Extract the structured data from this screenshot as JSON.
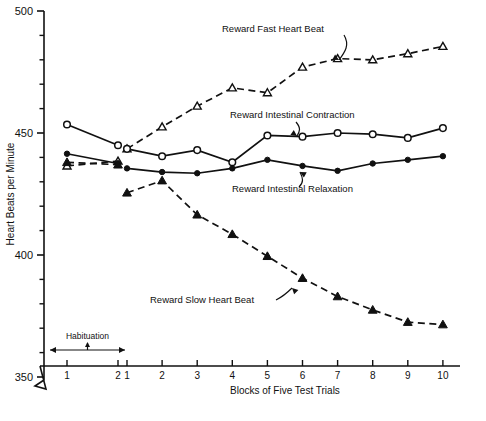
{
  "chart_data": {
    "type": "line",
    "title": "",
    "xlabel": "Blocks of Five Test Trials",
    "ylabel": "Heart Beats per Minute",
    "ylim": [
      350,
      500
    ],
    "y_ticks_major": [
      350,
      400,
      450,
      500
    ],
    "y_ticks_minor_step": 10,
    "axis_break": true,
    "grid": false,
    "legend_position": "inline-annotations",
    "x_habituation": [
      "1",
      "2"
    ],
    "x_test": [
      "1",
      "2",
      "3",
      "4",
      "5",
      "6",
      "7",
      "8",
      "9",
      "10"
    ],
    "habituation_label": "Habituation",
    "series": [
      {
        "name": "Reward Fast Heart Beat",
        "marker": "open-triangle",
        "line": "dashed",
        "habituation": [
          436.5,
          438.5
        ],
        "values": [
          443.5,
          452.5,
          461.0,
          468.5,
          466.5,
          477.0,
          480.5,
          480.0,
          482.5,
          485.5
        ]
      },
      {
        "name": "Reward Intestinal Contraction",
        "marker": "open-circle",
        "line": "solid",
        "habituation": [
          453.5,
          445.0
        ],
        "values": [
          443.5,
          440.5,
          443.0,
          438.0,
          449.0,
          448.5,
          450.0,
          449.5,
          448.0,
          452.0
        ]
      },
      {
        "name": "Reward Intestinal Relaxation",
        "marker": "filled-circle",
        "line": "solid",
        "habituation": [
          441.5,
          437.5
        ],
        "values": [
          435.5,
          434.0,
          433.5,
          435.5,
          439.0,
          436.5,
          434.5,
          437.5,
          439.0,
          440.5
        ]
      },
      {
        "name": "Reward Slow Heart Beat",
        "marker": "filled-triangle",
        "line": "dashed",
        "habituation": [
          438.0,
          437.0
        ],
        "values": [
          425.5,
          430.5,
          416.5,
          408.5,
          399.5,
          390.5,
          383.0,
          377.5,
          372.5,
          371.5
        ]
      }
    ],
    "annotations": [
      {
        "text": "Reward Fast Heart Beat",
        "points_to": "fast-series-block-6"
      },
      {
        "text": "Reward Intestinal Contraction",
        "points_to": "contraction-series-block-5"
      },
      {
        "text": "Reward Intestinal Relaxation",
        "points_to": "relaxation-series-block-6"
      },
      {
        "text": "Reward Slow Heart Beat",
        "points_to": "slow-series-block-7"
      }
    ]
  },
  "axes": {
    "y_title": "Heart Beats per Minute",
    "x_title": "Blocks of Five Test Trials",
    "y_tick_labels": [
      "500",
      "450",
      "400",
      "350"
    ],
    "x_tick_labels_habituation": [
      "1",
      "2"
    ],
    "x_tick_labels_test": [
      "1",
      "2",
      "3",
      "4",
      "5",
      "6",
      "7",
      "8",
      "9",
      "10"
    ]
  },
  "annotations": {
    "habituation": "Habituation",
    "fast": "Reward Fast Heart Beat",
    "contraction": "Reward Intestinal Contraction",
    "relaxation": "Reward Intestinal Relaxation",
    "slow": "Reward Slow Heart Beat"
  },
  "colors": {
    "ink": "#111111",
    "background": "#ffffff"
  }
}
